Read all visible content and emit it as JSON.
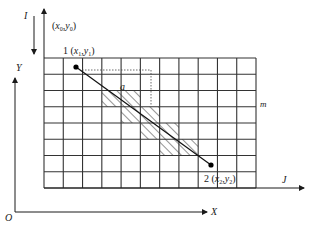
{
  "diagram": {
    "type": "raster grid line rasterization",
    "grid": {
      "columns": 11,
      "rows": 8,
      "left": 44,
      "right": 256,
      "top": 58,
      "bottom": 188,
      "stroke": "#333333"
    },
    "hatched_cells": [
      {
        "row": 2,
        "col": 3
      },
      {
        "row": 2,
        "col": 4
      },
      {
        "row": 3,
        "col": 4
      },
      {
        "row": 3,
        "col": 5
      },
      {
        "row": 4,
        "col": 5
      },
      {
        "row": 4,
        "col": 6
      },
      {
        "row": 5,
        "col": 6
      },
      {
        "row": 5,
        "col": 7
      }
    ],
    "line_segment": {
      "p1": {
        "x": 76,
        "y": 67,
        "label_num": "1",
        "label_coords": "(x1,y1)"
      },
      "p2": {
        "x": 211,
        "y": 165,
        "label_num": "2",
        "label_coords": "(x2,y2)"
      }
    },
    "labels": {
      "I_axis": "I",
      "origin_pixel": "(x0,y0)",
      "point1_num": "1",
      "point1_x": "x",
      "point1_xsub": "1",
      "point1_y": "y",
      "point1_ysub": "1",
      "point2_num": "2",
      "point2_x": "x",
      "point2_xsub": "2",
      "point2_y": "y",
      "point2_ysub": "2",
      "origin0_x": "x",
      "origin0_xsub": "0",
      "origin0_y": "y",
      "origin0_ysub": "0",
      "a": "a",
      "m": "m",
      "J_axis": "J",
      "Y_axis": "Y",
      "X_axis": "X",
      "O": "O"
    }
  }
}
